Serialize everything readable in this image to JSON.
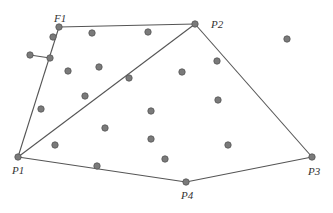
{
  "diagram": {
    "type": "convex-hull-points",
    "hull_vertices": [
      {
        "label": "F1",
        "x": 59,
        "y": 27,
        "lx": 54,
        "ly": 22
      },
      {
        "label": "P2",
        "x": 195,
        "y": 24,
        "lx": 211,
        "ly": 28
      },
      {
        "label": "P3",
        "x": 312,
        "y": 157,
        "lx": 308,
        "ly": 175
      },
      {
        "label": "P4",
        "x": 186,
        "y": 182,
        "lx": 181,
        "ly": 199
      },
      {
        "label": "P1",
        "x": 18,
        "y": 157,
        "lx": 12,
        "ly": 174
      }
    ],
    "edges": [
      [
        59,
        27,
        195,
        24
      ],
      [
        195,
        24,
        312,
        157
      ],
      [
        312,
        157,
        186,
        182
      ],
      [
        186,
        182,
        18,
        157
      ],
      [
        18,
        157,
        59,
        27
      ],
      [
        18,
        157,
        195,
        24
      ],
      [
        30,
        55,
        50,
        58
      ]
    ],
    "interior_points": [
      [
        53,
        37
      ],
      [
        50,
        58
      ],
      [
        30,
        55
      ],
      [
        92,
        33
      ],
      [
        148,
        32
      ],
      [
        68,
        71
      ],
      [
        99,
        67
      ],
      [
        129,
        78
      ],
      [
        182,
        72
      ],
      [
        217,
        61
      ],
      [
        287,
        39
      ],
      [
        41,
        109
      ],
      [
        85,
        96
      ],
      [
        151,
        111
      ],
      [
        218,
        100
      ],
      [
        105,
        128
      ],
      [
        151,
        139
      ],
      [
        55,
        145
      ],
      [
        165,
        159
      ],
      [
        228,
        145
      ],
      [
        97,
        166
      ]
    ],
    "colors": {
      "edge": "#555555",
      "point_fill": "#7a7a7a",
      "label": "#333333"
    }
  }
}
